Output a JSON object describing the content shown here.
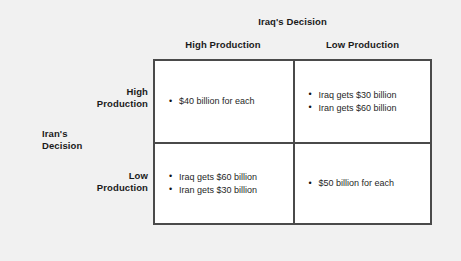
{
  "figure": {
    "column_group_title": "Iraq's Decision",
    "row_group_title_line1": "Iran's",
    "row_group_title_line2": "Decision",
    "column_headers": [
      "High Production",
      "Low Production"
    ],
    "row_headers": [
      {
        "line1": "High",
        "line2": "Production"
      },
      {
        "line1": "Low",
        "line2": "Production"
      }
    ],
    "cells": [
      {
        "row": "High Production",
        "column": "High Production",
        "items": [
          "$40 billion for each"
        ]
      },
      {
        "row": "High Production",
        "column": "Low Production",
        "items": [
          "Iraq gets $30 billion",
          "Iran gets $60 billion"
        ]
      },
      {
        "row": "Low Production",
        "column": "High Production",
        "items": [
          "Iraq gets $60 billion",
          "Iran gets $30 billion"
        ]
      },
      {
        "row": "Low Production",
        "column": "Low Production",
        "items": [
          "$50 billion for each"
        ]
      }
    ],
    "colors": {
      "background": "#f1f1f1",
      "cell_background": "#ffffff",
      "border": "#4a4a4a",
      "text": "#1a1a1a"
    }
  }
}
